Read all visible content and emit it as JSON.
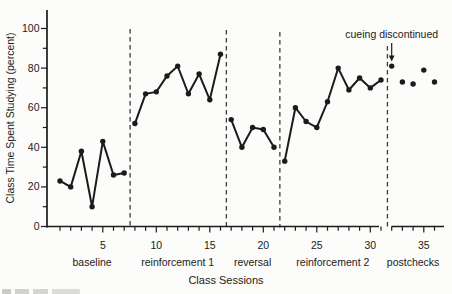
{
  "figure": {
    "background": "#fcfcfa",
    "ink": "#1b1b1b",
    "divider_color": "#3a3a3a"
  },
  "chart_data": {
    "type": "line",
    "title": "",
    "xlabel": "Class Sessions",
    "ylabel": "Class Time Spent Studying (percent)",
    "x_axis": {
      "sessions_min": 1,
      "sessions_max": 36,
      "labeled_ticks": [
        5,
        10,
        15,
        20,
        25,
        30,
        35
      ],
      "minor_tick_step": 1,
      "axis_break_before_session": 32
    },
    "y_axis": {
      "min": 0,
      "max": 100,
      "labeled_ticks": [
        0,
        20,
        40,
        60,
        80,
        100
      ],
      "minor_tick_step": 10
    },
    "grid": "off",
    "legend": "none",
    "phases": [
      {
        "label": "baseline",
        "start_session": 1,
        "connected": true,
        "values": [
          23,
          20,
          38,
          10,
          43,
          26,
          27
        ]
      },
      {
        "label": "reinforcement 1",
        "start_session": 8,
        "connected": true,
        "values": [
          52,
          67,
          68,
          76,
          81,
          67,
          77,
          64,
          87
        ]
      },
      {
        "label": "reversal",
        "start_session": 17,
        "connected": true,
        "values": [
          54,
          40,
          50,
          49,
          40
        ]
      },
      {
        "label": "reinforcement 2",
        "start_session": 22,
        "connected": true,
        "values": [
          33,
          60,
          53,
          50,
          63,
          80,
          69,
          75,
          70,
          74
        ]
      },
      {
        "label": "postchecks",
        "start_session": 32,
        "connected": false,
        "values": [
          81,
          73,
          72,
          79,
          73
        ]
      }
    ],
    "phase_divider_sessions": [
      7.55,
      16.55,
      21.55,
      31.6
    ],
    "annotation": {
      "text": "cueing discontinued",
      "points_to_session": 32,
      "points_to_value": 81
    }
  }
}
